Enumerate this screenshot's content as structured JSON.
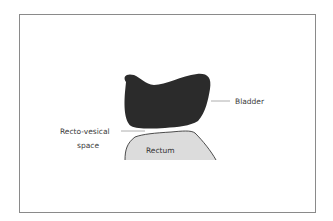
{
  "diagram": {
    "labels": {
      "bladder": "Bladder",
      "space_line1": "Recto-vesical",
      "space_line2": "space",
      "rectum": "Rectum"
    },
    "colors": {
      "bladder_fill": "#2b2b2b",
      "rectum_fill": "#dcdcdc",
      "rectum_stroke": "#3a3a3a",
      "leader_line": "#9a9a9a",
      "frame_border": "#8a8a8a"
    }
  }
}
